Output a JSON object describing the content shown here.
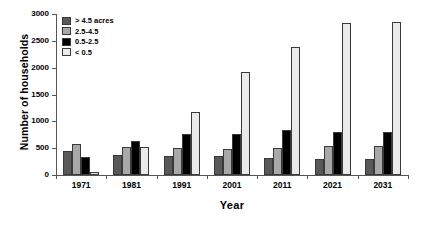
{
  "chart_data": {
    "type": "bar",
    "title": "",
    "xlabel": "Year",
    "ylabel": "Number of households",
    "categories": [
      "1971",
      "1981",
      "1991",
      "2001",
      "2011",
      "2021",
      "2031"
    ],
    "series": [
      {
        "name": "> 4.5 acres",
        "color": "#595959",
        "values": [
          450,
          380,
          355,
          355,
          310,
          300,
          300
        ]
      },
      {
        "name": "2.5-4.5",
        "color": "#a8a8a8",
        "values": [
          580,
          530,
          495,
          490,
          510,
          535,
          535
        ]
      },
      {
        "name": "0.5-2.5",
        "color": "#000000",
        "values": [
          330,
          640,
          770,
          755,
          830,
          800,
          795
        ]
      },
      {
        "name": "< 0.5",
        "color": "#eaeaea",
        "values": [
          50,
          520,
          1180,
          1920,
          2390,
          2830,
          2850
        ]
      }
    ],
    "ylim": [
      0,
      3000
    ],
    "yticks": [
      0,
      500,
      1000,
      1500,
      2000,
      2500,
      3000
    ],
    "ytick_labels": [
      "0",
      "500",
      "1000",
      "1500",
      "2000",
      "2500",
      "3000"
    ],
    "grid": false,
    "legend_position": "top-left",
    "legend_entries": [
      "> 4.5 acres",
      "2.5-4.5",
      "0.5-2.5",
      "< 0.5"
    ]
  }
}
